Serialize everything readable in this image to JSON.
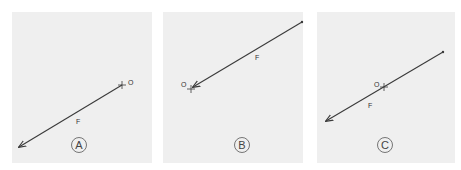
{
  "panels": [
    {
      "id": "A",
      "caption": "A",
      "origin_label": "O",
      "force_label": "F",
      "arrow": {
        "from": [
          122,
          85
        ],
        "to": [
          18,
          148
        ],
        "tail_dot": false
      },
      "origin": [
        122,
        85
      ]
    },
    {
      "id": "B",
      "caption": "B",
      "origin_label": "O",
      "force_label": "F",
      "arrow": {
        "from": [
          302,
          22
        ],
        "to": [
          192,
          88
        ],
        "tail_dot": true
      },
      "origin": [
        191,
        89
      ]
    },
    {
      "id": "C",
      "caption": "C",
      "origin_label": "O",
      "force_label": "F",
      "arrow": {
        "from": [
          443,
          52
        ],
        "to": [
          325,
          122
        ],
        "tail_dot": true
      },
      "origin": [
        384,
        87
      ]
    }
  ],
  "colors": {
    "panel_bg": "#efefef",
    "line": "#3a3a3a",
    "text": "#333333"
  }
}
